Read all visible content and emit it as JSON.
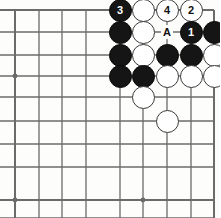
{
  "diagram": {
    "type": "go-board-diagram",
    "board": {
      "line_color": "#6b6b6b",
      "background_color": "#fdfdfb",
      "edge_right_x": 214,
      "edge_top_y": 10,
      "cell_size": 23.6,
      "columns_x": [
        15,
        39,
        62,
        86,
        96,
        120,
        143,
        167,
        191,
        214
      ],
      "rows_y": [
        10,
        32,
        55,
        76,
        97,
        121,
        144,
        167,
        178,
        200
      ],
      "vertical_lines_x": [
        15,
        39,
        62,
        86,
        120,
        143,
        167,
        191,
        214
      ],
      "horizontal_lines_y": [
        10,
        32,
        55,
        76,
        97,
        121,
        144,
        167,
        200
      ],
      "grid_cols": 9,
      "grid_rows": 9
    },
    "star_points": [
      {
        "x": 15,
        "y": 76
      },
      {
        "x": 15,
        "y": 200
      },
      {
        "x": 143,
        "y": 200
      }
    ],
    "stone_radius": 11.5,
    "stones": [
      {
        "id": "s1",
        "color": "black",
        "x": 120,
        "y": 10,
        "label": "3"
      },
      {
        "id": "s2",
        "color": "white",
        "x": 143,
        "y": 10,
        "label": ""
      },
      {
        "id": "s3",
        "color": "white",
        "x": 167,
        "y": 10,
        "label": "4"
      },
      {
        "id": "s4",
        "color": "white",
        "x": 191,
        "y": 10,
        "label": "2"
      },
      {
        "id": "s5",
        "color": "black",
        "x": 120,
        "y": 32,
        "label": ""
      },
      {
        "id": "s6",
        "color": "white",
        "x": 143,
        "y": 32,
        "label": ""
      },
      {
        "id": "s7",
        "color": "black",
        "x": 191,
        "y": 32,
        "label": "1"
      },
      {
        "id": "s8",
        "color": "black",
        "x": 214,
        "y": 32,
        "label": ""
      },
      {
        "id": "s9",
        "color": "black",
        "x": 120,
        "y": 55,
        "label": ""
      },
      {
        "id": "s10",
        "color": "white",
        "x": 143,
        "y": 55,
        "label": ""
      },
      {
        "id": "s11",
        "color": "black",
        "x": 167,
        "y": 55,
        "label": ""
      },
      {
        "id": "s12",
        "color": "black",
        "x": 191,
        "y": 55,
        "label": ""
      },
      {
        "id": "s13",
        "color": "white",
        "x": 214,
        "y": 55,
        "label": ""
      },
      {
        "id": "s14",
        "color": "black",
        "x": 120,
        "y": 76,
        "label": ""
      },
      {
        "id": "s15",
        "color": "black",
        "x": 143,
        "y": 76,
        "label": ""
      },
      {
        "id": "s16",
        "color": "white",
        "x": 167,
        "y": 76,
        "label": ""
      },
      {
        "id": "s17",
        "color": "white",
        "x": 191,
        "y": 76,
        "label": ""
      },
      {
        "id": "s18",
        "color": "white",
        "x": 214,
        "y": 76,
        "label": ""
      },
      {
        "id": "s19",
        "color": "white",
        "x": 143,
        "y": 97,
        "label": ""
      },
      {
        "id": "s20",
        "color": "white",
        "x": 167,
        "y": 121,
        "label": ""
      }
    ],
    "point_markers": [
      {
        "id": "m1",
        "text": "A",
        "x": 167,
        "y": 32
      }
    ],
    "move_numbers": [
      "1",
      "2",
      "3",
      "4"
    ]
  }
}
